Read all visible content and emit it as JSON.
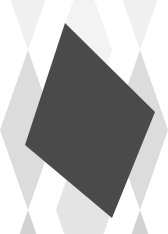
{
  "image": {
    "description": "Abstract composition: dark gray quadrilateral over a light gray harlequin diamond pattern",
    "width": 168,
    "height": 234,
    "colors": {
      "background": "#ffffff",
      "diamond_top": "#ececec",
      "diamond_mid": "#dcdcdc",
      "diamond_bottom": "#d2d2d2",
      "shape": "#4a4a4a"
    },
    "shape_points": "65,23 155,112 112,218 25,145",
    "diamonds": [
      {
        "points": "28,-110 56,-30 28,50 0,-30",
        "fill": "#f0f0f0"
      },
      {
        "points": "140,-110 168,-30 140,50 112,-30",
        "fill": "#f0f0f0"
      },
      {
        "points": "84,-30 112,50 84,130 56,50",
        "fill": "#f3f3f3"
      },
      {
        "points": "28,50 56,130 28,210 0,130",
        "fill": "#dcdcdc"
      },
      {
        "points": "140,50 168,130 140,210 112,130",
        "fill": "#dcdcdc"
      },
      {
        "points": "84,130 112,210 84,290 56,210",
        "fill": "#e4e4e4"
      },
      {
        "points": "28,210 56,290 28,370 0,290",
        "fill": "#d2d2d2"
      },
      {
        "points": "140,210 168,290 140,370 112,290",
        "fill": "#d2d2d2"
      }
    ]
  }
}
